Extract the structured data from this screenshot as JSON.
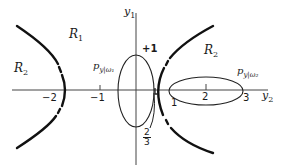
{
  "diagram": {
    "axes": {
      "horizontal_label": "y",
      "horizontal_sub": "2",
      "vertical_label": "y",
      "vertical_sub": "1"
    },
    "tick_labels": {
      "neg2": "−2",
      "neg1": "−1",
      "one": "1",
      "two": "2",
      "three": "3",
      "plus_one": "+1"
    },
    "fraction": {
      "numerator": "2",
      "denominator": "3"
    },
    "regions": {
      "r1": {
        "label": "R",
        "sub": "1"
      },
      "r2_left": {
        "label": "R",
        "sub": "2"
      },
      "r2_right": {
        "label": "R",
        "sub": "2"
      }
    },
    "densities": {
      "omega1": {
        "label": "p",
        "sub": "y|ω₁"
      },
      "omega2": {
        "label": "p",
        "sub": "y|ω₂"
      }
    },
    "colors": {
      "line": "#1a1a1a",
      "boundary": "#111111",
      "background": "#ffffff"
    }
  }
}
